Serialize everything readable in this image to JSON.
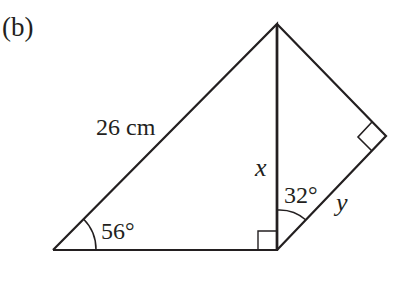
{
  "figure": {
    "part_label": "(b)",
    "hypotenuse_label": "26 cm",
    "angle_left_label": "56°",
    "angle_right_label": "32°",
    "side_x_label": "x",
    "side_y_label": "y"
  },
  "colors": {
    "stroke": "#231f20",
    "background": "#ffffff"
  }
}
